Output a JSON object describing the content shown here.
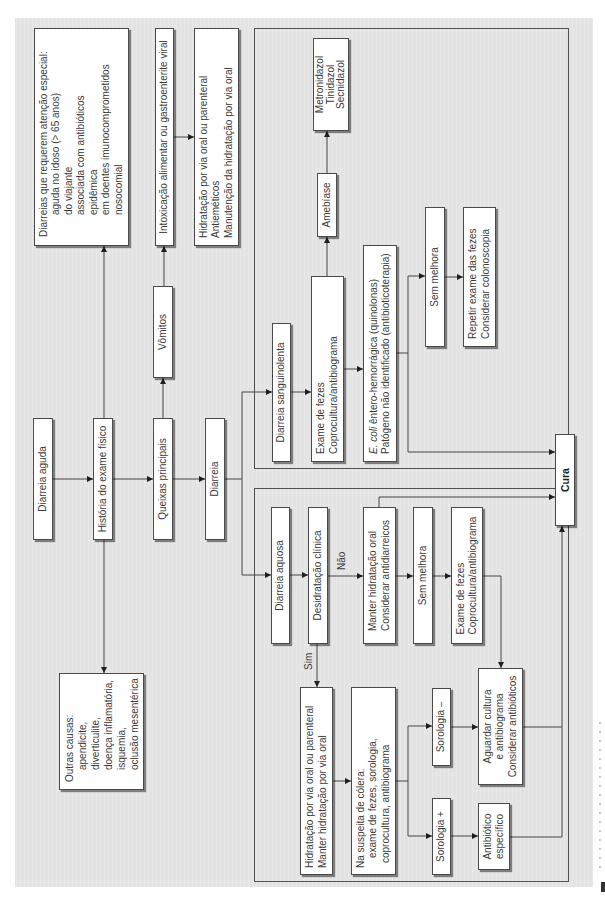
{
  "nodes": {
    "diarreia_aguda": {
      "lines": [
        "Diarreia aguda"
      ]
    },
    "historia": {
      "lines": [
        "História do exame físico"
      ]
    },
    "queixas": {
      "lines": [
        "Queixas principais"
      ]
    },
    "diarreia": {
      "lines": [
        "Diarreia"
      ]
    },
    "vomitos": {
      "lines": [
        "Vômitos"
      ]
    },
    "diarreias_especiais": {
      "lines": [
        "Diarreias que requerem atenção especial:",
        "aguda no idoso (> 65 anos)",
        "do viajante",
        "associada com antibióticos",
        "epidêmica",
        "em doentes imunocomprometidos",
        "nosocomial"
      ]
    },
    "outras_causas": {
      "lines": [
        "Outras causas:",
        "apendicite,",
        "diverticulite,",
        "doença inflamatória,",
        "isquemia,",
        "oclusão mesentérica"
      ]
    },
    "intoxicacao": {
      "lines": [
        "Intoxicação alimentar ou gastroenterite viral"
      ]
    },
    "hidratacao_vomitos": {
      "lines": [
        "Hidratação por via oral ou parenteral",
        "Antieméticos",
        "Manutenção da hidratação por via oral"
      ]
    },
    "diarreia_sanguinolenta": {
      "lines": [
        "Diarreia sanguinolenta"
      ]
    },
    "exame_fezes_sanguinolenta": {
      "lines": [
        "Exame de fezes",
        "Coprocultura/antibiograma"
      ]
    },
    "amebiase": {
      "lines": [
        "Amebíase"
      ]
    },
    "metronidazol": {
      "lines": [
        "Metronidazol",
        "Tinidazol",
        "Secnidazol"
      ]
    },
    "ecoli": {
      "italic": "E. coli",
      "lines": [
        " êntero-hemorrágica (quinolonas)",
        "Patógeno não identificado (antibioticoterapia)"
      ]
    },
    "sem_melhora_sanguinolenta": {
      "lines": [
        "Sem melhora"
      ]
    },
    "repetir_exame": {
      "lines": [
        "Repetir exame das fezes",
        "Considerar colonoscopia"
      ]
    },
    "cura": {
      "lines": [
        "Cura"
      ]
    },
    "diarreia_aquosa": {
      "lines": [
        "Diarreia aquosa"
      ]
    },
    "desidratacao": {
      "lines": [
        "Desidratação clínica"
      ]
    },
    "manter_hidratacao": {
      "lines": [
        "Manter hidratação oral",
        "Considerar antidiarreicos"
      ]
    },
    "sem_melhora_aquosa": {
      "lines": [
        "Sem melhora"
      ]
    },
    "exame_fezes_aquosa": {
      "lines": [
        "Exame de fezes",
        "Coprocultura/antibiograma"
      ]
    },
    "hidratacao_colera": {
      "lines": [
        "Hidratação por via oral ou parenteral",
        "Manter hidratação por via oral"
      ]
    },
    "suspeita_colera": {
      "lines": [
        "Na suspeita de cólera:",
        "exame de fezes, sorologia,",
        "coprocultura, antibiograma"
      ]
    },
    "sorologia_negativa": {
      "lines": [
        "Sorologia –"
      ]
    },
    "sorologia_positiva": {
      "lines": [
        "Sorologia +"
      ]
    },
    "aguardar_cultura": {
      "lines": [
        "Aguardar cultura",
        "e antibiograma",
        "Considerar antibióticos"
      ]
    },
    "antibiotico_especifico": {
      "lines": [
        "Antibiótico",
        "específico"
      ]
    }
  },
  "edge_labels": {
    "sim": "Sim",
    "nao": "Não"
  },
  "connections": [
    {
      "from": "diarreia_aguda",
      "to": "historia"
    },
    {
      "from": "historia",
      "to": "queixas"
    },
    {
      "from": "historia",
      "to": "diarreias_especiais"
    },
    {
      "from": "historia",
      "to": "outras_causas"
    },
    {
      "from": "queixas",
      "to": "diarreia"
    },
    {
      "from": "queixas",
      "to": "vomitos"
    },
    {
      "from": "vomitos",
      "to": "intoxicacao"
    },
    {
      "from": "intoxicacao",
      "to": "hidratacao_vomitos"
    },
    {
      "from": "diarreia",
      "to": "diarreia_sanguinolenta"
    },
    {
      "from": "diarreia",
      "to": "diarreia_aquosa"
    },
    {
      "from": "diarreia_sanguinolenta",
      "to": "exame_fezes_sanguinolenta"
    },
    {
      "from": "exame_fezes_sanguinolenta",
      "to": "amebiase"
    },
    {
      "from": "exame_fezes_sanguinolenta",
      "to": "ecoli"
    },
    {
      "from": "amebiase",
      "to": "metronidazol"
    },
    {
      "from": "ecoli",
      "to": "sem_melhora_sanguinolenta"
    },
    {
      "from": "ecoli",
      "to": "cura"
    },
    {
      "from": "sem_melhora_sanguinolenta",
      "to": "repetir_exame"
    },
    {
      "from": "diarreia_aquosa",
      "to": "desidratacao"
    },
    {
      "from": "desidratacao",
      "to": "manter_hidratacao",
      "label": "Não"
    },
    {
      "from": "desidratacao",
      "to": "hidratacao_colera",
      "label": "Sim"
    },
    {
      "from": "manter_hidratacao",
      "to": "sem_melhora_aquosa"
    },
    {
      "from": "manter_hidratacao",
      "to": "cura"
    },
    {
      "from": "sem_melhora_aquosa",
      "to": "exame_fezes_aquosa"
    },
    {
      "from": "exame_fezes_aquosa",
      "to": "aguardar_cultura"
    },
    {
      "from": "hidratacao_colera",
      "to": "suspeita_colera"
    },
    {
      "from": "suspeita_colera",
      "to": "sorologia_positiva"
    },
    {
      "from": "suspeita_colera",
      "to": "sorologia_negativa"
    },
    {
      "from": "sorologia_positiva",
      "to": "antibiotico_especifico"
    },
    {
      "from": "sorologia_negativa",
      "to": "aguardar_cultura"
    },
    {
      "from": "antibiotico_especifico",
      "to": "cura"
    },
    {
      "from": "aguardar_cultura",
      "to": "cura"
    }
  ],
  "colors": {
    "background": "#e3e3e3",
    "box_fill": "#ffffff",
    "box_border": "#4a4a4a",
    "connector": "#464646",
    "text": "#3a3a3a"
  }
}
